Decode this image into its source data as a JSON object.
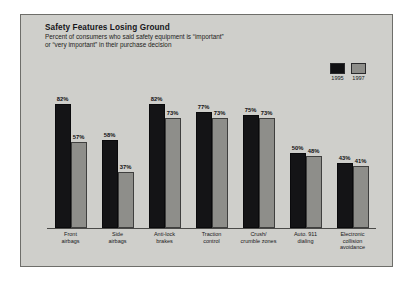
{
  "chart_data": {
    "type": "bar",
    "title": "Safety Features Losing Ground",
    "subtitle_line1": "Percent of consumers who said safety equipment is “important”",
    "subtitle_line2": "or “very important” in their purchase decision",
    "xlabel": "",
    "ylabel": "",
    "ylim": [
      0,
      100
    ],
    "grid": false,
    "legend_position": "top-right",
    "categories": [
      "Front\nairbags",
      "Side\nairbags",
      "Anti-lock\nbrakes",
      "Traction\ncontrol",
      "Crush/\ncrumble zones",
      "Auto. 911\ndialing",
      "Electronic\ncollision\navoidance"
    ],
    "series": [
      {
        "name": "1995",
        "color": "#141416",
        "values": [
          82,
          58,
          82,
          77,
          75,
          50,
          43
        ],
        "labels": [
          "82%",
          "58%",
          "82%",
          "77%",
          "75%",
          "50%",
          "43%"
        ]
      },
      {
        "name": "1997",
        "color": "#8e8e8a",
        "values": [
          57,
          37,
          73,
          73,
          73,
          48,
          41
        ],
        "labels": [
          "57%",
          "37%",
          "73%",
          "73%",
          "73%",
          "48%",
          "41%"
        ]
      }
    ]
  },
  "legend": {
    "items": [
      {
        "label": "1995",
        "swatch_class": "s1995",
        "color": "#141416"
      },
      {
        "label": "1997",
        "swatch_class": "s1997",
        "color": "#8e8e8a"
      }
    ]
  },
  "style": {
    "panel_background": "#cfcfcb",
    "panel_border": "#6e6e6a",
    "axis_color": "#4a4a48",
    "text_color": "#16161a"
  }
}
